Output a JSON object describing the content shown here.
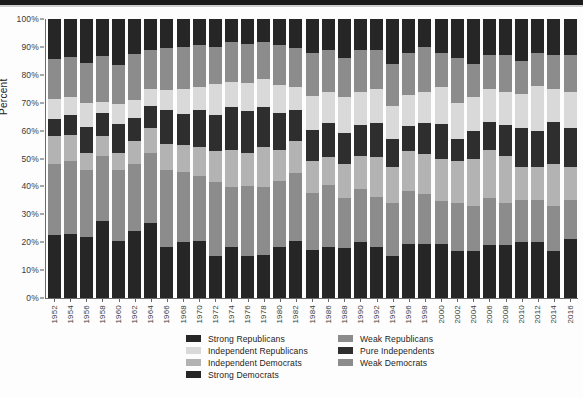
{
  "chart_data": {
    "type": "bar",
    "title": "",
    "xlabel": "",
    "ylabel": "Percent",
    "ylim": [
      0,
      100
    ],
    "ytick_labels": [
      "0%",
      "10%",
      "20%",
      "30%",
      "40%",
      "50%",
      "60%",
      "70%",
      "80%",
      "90%",
      "100%"
    ],
    "ytick_values": [
      0,
      10,
      20,
      30,
      40,
      50,
      60,
      70,
      80,
      90,
      100
    ],
    "grid": false,
    "stacked": true,
    "stack_order_bottom_to_top": [
      "Strong Democrats",
      "Weak Democrats",
      "Independent Democrats",
      "Pure Independents",
      "Independent Republicans",
      "Weak Republicans",
      "Strong Republicans"
    ],
    "legend_position": "bottom",
    "categories": [
      "1952",
      "1954",
      "1956",
      "1958",
      "1960",
      "1962",
      "1964",
      "1966",
      "1968",
      "1970",
      "1972",
      "1974",
      "1976",
      "1978",
      "1980",
      "1982",
      "1984",
      "1986",
      "1988",
      "1990",
      "1992",
      "1994",
      "1996",
      "1998",
      "2000",
      "2002",
      "2004",
      "2006",
      "2008",
      "2010",
      "2012",
      "2014",
      "2016"
    ],
    "series": [
      {
        "name": "Strong Democrats",
        "color": "#262626",
        "values": [
          22,
          22,
          21,
          27,
          20,
          23,
          27,
          18,
          20,
          20,
          15,
          18,
          15,
          15,
          18,
          20,
          17,
          18,
          18,
          20,
          18,
          15,
          19,
          19,
          19,
          17,
          17,
          19,
          19,
          20,
          20,
          17,
          21
        ]
      },
      {
        "name": "Weak Democrats",
        "color": "#8c8c8c",
        "values": [
          25,
          25,
          23,
          23,
          25,
          23,
          25,
          27,
          25,
          23,
          26,
          21,
          25,
          24,
          23,
          24,
          20,
          22,
          18,
          19,
          18,
          19,
          19,
          18,
          15,
          17,
          16,
          17,
          15,
          15,
          15,
          16,
          14
        ]
      },
      {
        "name": "Independent Democrats",
        "color": "#b3b3b3",
        "values": [
          10,
          9,
          6,
          7,
          6,
          8,
          9,
          9,
          10,
          10,
          11,
          13,
          12,
          14,
          11,
          11,
          11,
          10,
          12,
          12,
          14,
          13,
          14,
          14,
          15,
          15,
          17,
          17,
          17,
          12,
          12,
          15,
          12
        ]
      },
      {
        "name": "Pure Independents",
        "color": "#2e2e2e",
        "values": [
          6,
          7,
          9,
          8,
          10,
          8,
          8,
          12,
          11,
          13,
          13,
          15,
          15,
          14,
          13,
          11,
          11,
          12,
          11,
          11,
          12,
          10,
          9,
          11,
          12,
          8,
          10,
          10,
          11,
          14,
          13,
          15,
          14
        ]
      },
      {
        "name": "Independent Republicans",
        "color": "#d9d9d9",
        "values": [
          7,
          6,
          8,
          4,
          7,
          6,
          6,
          7,
          9,
          8,
          11,
          9,
          10,
          10,
          10,
          8,
          12,
          11,
          13,
          12,
          12,
          12,
          11,
          11,
          13,
          13,
          12,
          12,
          12,
          12,
          16,
          12,
          13
        ]
      },
      {
        "name": "Weak Republicans",
        "color": "#8c8c8c",
        "values": [
          14,
          14,
          14,
          16,
          14,
          16,
          14,
          15,
          15,
          15,
          13,
          14,
          14,
          13,
          14,
          14,
          15,
          15,
          14,
          15,
          14,
          15,
          15,
          16,
          12,
          16,
          12,
          12,
          13,
          12,
          12,
          12,
          13
        ]
      },
      {
        "name": "Strong Republicans",
        "color": "#262626",
        "values": [
          14,
          13,
          15,
          13,
          16,
          12,
          11,
          10,
          10,
          9,
          10,
          8,
          9,
          8,
          9,
          10,
          12,
          11,
          14,
          11,
          11,
          16,
          12,
          10,
          12,
          14,
          16,
          13,
          13,
          15,
          12,
          13,
          13
        ]
      }
    ],
    "legend_entries": [
      {
        "label": "Strong Republicans",
        "color": "#262626"
      },
      {
        "label": "Weak Republicans",
        "color": "#8c8c8c"
      },
      {
        "label": "Independent Republicans",
        "color": "#d9d9d9"
      },
      {
        "label": "Pure Independents",
        "color": "#2e2e2e"
      },
      {
        "label": "Independent Democrats",
        "color": "#b3b3b3"
      },
      {
        "label": "Weak Democrats",
        "color": "#8c8c8c"
      },
      {
        "label": "Strong Democrats",
        "color": "#262626"
      }
    ]
  },
  "source_note": ""
}
